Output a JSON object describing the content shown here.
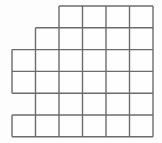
{
  "figure": {
    "kind": "grid-diagram",
    "width": 162,
    "height": 143,
    "background_color": "#fdfdfd"
  },
  "style": {
    "line_color": "#6b6b6b",
    "line_width": 1.4,
    "cell_fill": "#fefefe",
    "grid_on": true
  },
  "lattice": {
    "origin_x": 12,
    "origin_y": 6,
    "cell_width": 23.5,
    "cell_height": 21.8,
    "columns": 6,
    "rows": 6,
    "column_x": [
      12,
      35.5,
      59,
      82.5,
      106,
      129.5,
      153
    ],
    "row_y": [
      6,
      27.8,
      49.6,
      71.4,
      93.2,
      115,
      136.8
    ]
  },
  "chart_data": {
    "type": "heatmap",
    "xlabel": "",
    "ylabel": "",
    "x": [
      1,
      2,
      3,
      4,
      5,
      6
    ],
    "y": [
      1,
      2,
      3,
      4,
      5,
      6
    ],
    "grid": [
      [
        0,
        0,
        1,
        1,
        1,
        1
      ],
      [
        0,
        1,
        1,
        1,
        1,
        1
      ],
      [
        1,
        1,
        1,
        1,
        1,
        1
      ],
      [
        1,
        1,
        1,
        1,
        1,
        1
      ],
      [
        0,
        1,
        1,
        1,
        1,
        1
      ],
      [
        1,
        1,
        1,
        1,
        1,
        1
      ]
    ],
    "row_descriptions": [
      "Row 1: columns 3-6 filled (4 cells)",
      "Row 2: columns 2-6 filled (5 cells)",
      "Row 3: columns 1-6 filled (6 cells)",
      "Row 4: columns 1-6 filled (6 cells)",
      "Row 5: columns 2-6 filled (5 cells)",
      "Row 6: columns 1-6 filled (6 cells)"
    ],
    "row_counts": [
      4,
      5,
      6,
      6,
      5,
      6
    ],
    "column_counts": [
      3,
      6,
      6,
      6,
      6,
      6
    ],
    "total_cells": 33,
    "legend": []
  },
  "cells": [
    {
      "row": 1,
      "col": 3
    },
    {
      "row": 1,
      "col": 4
    },
    {
      "row": 1,
      "col": 5
    },
    {
      "row": 1,
      "col": 6
    },
    {
      "row": 2,
      "col": 2
    },
    {
      "row": 2,
      "col": 3
    },
    {
      "row": 2,
      "col": 4
    },
    {
      "row": 2,
      "col": 5
    },
    {
      "row": 2,
      "col": 6
    },
    {
      "row": 3,
      "col": 1
    },
    {
      "row": 3,
      "col": 2
    },
    {
      "row": 3,
      "col": 3
    },
    {
      "row": 3,
      "col": 4
    },
    {
      "row": 3,
      "col": 5
    },
    {
      "row": 3,
      "col": 6
    },
    {
      "row": 4,
      "col": 1
    },
    {
      "row": 4,
      "col": 2
    },
    {
      "row": 4,
      "col": 3
    },
    {
      "row": 4,
      "col": 4
    },
    {
      "row": 4,
      "col": 5
    },
    {
      "row": 4,
      "col": 6
    },
    {
      "row": 5,
      "col": 2
    },
    {
      "row": 5,
      "col": 3
    },
    {
      "row": 5,
      "col": 4
    },
    {
      "row": 5,
      "col": 5
    },
    {
      "row": 5,
      "col": 6
    },
    {
      "row": 6,
      "col": 1
    },
    {
      "row": 6,
      "col": 2
    },
    {
      "row": 6,
      "col": 3
    },
    {
      "row": 6,
      "col": 4
    },
    {
      "row": 6,
      "col": 5
    },
    {
      "row": 6,
      "col": 6
    }
  ]
}
